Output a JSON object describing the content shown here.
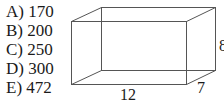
{
  "question": {
    "options": [
      {
        "letter": "A",
        "label": "A) 170"
      },
      {
        "letter": "B",
        "label": "B) 200"
      },
      {
        "letter": "C",
        "label": "C) 250"
      },
      {
        "letter": "D",
        "label": "D) 300"
      },
      {
        "letter": "E",
        "label": "E) 472"
      }
    ]
  },
  "figure": {
    "shape": "rectangular-prism",
    "dimensions": {
      "length": "12",
      "width": "7",
      "height": "8"
    },
    "line_color": "#555555"
  }
}
